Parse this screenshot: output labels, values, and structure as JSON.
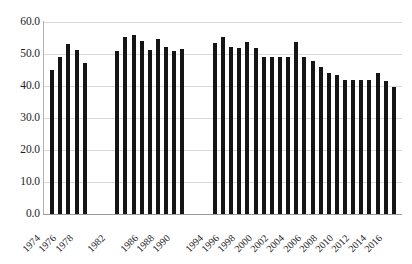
{
  "chart_data": {
    "type": "bar",
    "title": "",
    "subtitle": "",
    "xlabel": "",
    "ylabel": "",
    "ylim": [
      0,
      60
    ],
    "ytick_step": 10,
    "ytick_labels": [
      "60.0",
      "50.0",
      "40.0",
      "30.0",
      "20.0",
      "10.0",
      "0.0"
    ],
    "ytick_values": [
      60,
      50,
      40,
      30,
      20,
      10,
      0
    ],
    "grid": true,
    "legend": null,
    "bar_color": "#151515",
    "grid_color": "#d9d9d9",
    "axis_color": "#9a9a9a",
    "xtick_label_rotation": -45,
    "xtick_labels_shown": [
      "1974",
      "1976",
      "1978",
      "1982",
      "1986",
      "1988",
      "1990",
      "1994",
      "1996",
      "1998",
      "2000",
      "2002",
      "2004",
      "2006",
      "2008",
      "2010",
      "2012",
      "2014",
      "2016"
    ],
    "categories": [
      "1974",
      "1975",
      "1976",
      "1977",
      "1978",
      "1982",
      "1983",
      "1984",
      "1985",
      "1986",
      "1987",
      "1988",
      "1989",
      "1990",
      "1994",
      "1995",
      "1996",
      "1997",
      "1998",
      "1999",
      "2000",
      "2001",
      "2002",
      "2003",
      "2004",
      "2005",
      "2006",
      "2007",
      "2008",
      "2009",
      "2010",
      "2011",
      "2012",
      "2013",
      "2014",
      "2015",
      "2016"
    ],
    "values": [
      45.0,
      49.2,
      53.0,
      51.1,
      47.1,
      50.8,
      55.2,
      55.8,
      54.2,
      51.1,
      54.6,
      52.2,
      51.0,
      51.5,
      53.3,
      55.3,
      52.2,
      52.0,
      53.8,
      51.8,
      49.0,
      49.0,
      49.0,
      49.0,
      53.8,
      49.0,
      47.8,
      46.0,
      44.0,
      43.5,
      42.0,
      42.0,
      42.0,
      41.8,
      44.0,
      41.5,
      39.8
    ]
  }
}
